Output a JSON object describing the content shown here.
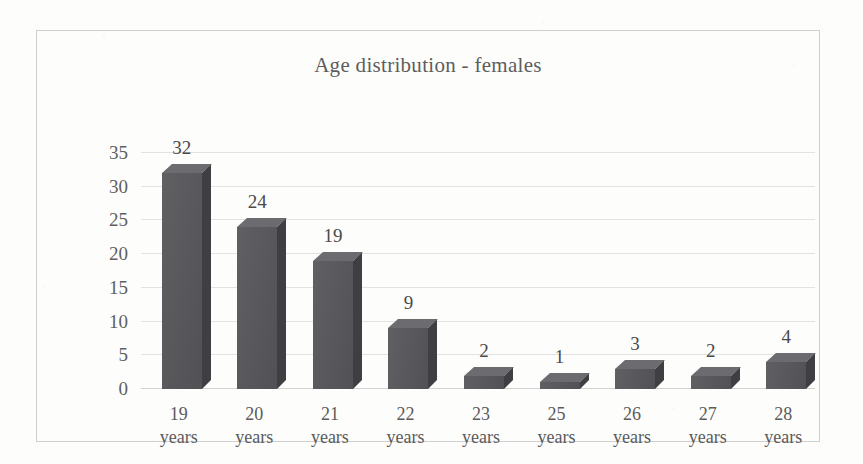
{
  "chart_data": {
    "type": "bar",
    "title": "Age distribution - females",
    "xlabel": "",
    "ylabel": "",
    "categories": [
      "19 years",
      "20 years",
      "21 years",
      "22 years",
      "23 years",
      "25 years",
      "26 years",
      "27 years",
      "28 years"
    ],
    "category_numbers": [
      "19",
      "20",
      "21",
      "22",
      "23",
      "25",
      "26",
      "27",
      "28"
    ],
    "category_unit": "years",
    "values": [
      32,
      24,
      19,
      9,
      2,
      1,
      3,
      2,
      4
    ],
    "data_labels": [
      "32",
      "24",
      "19",
      "9",
      "2",
      "1",
      "3",
      "2",
      "4"
    ],
    "ylim": [
      0,
      35
    ],
    "yticks": [
      0,
      5,
      10,
      15,
      20,
      25,
      30,
      35
    ],
    "ytick_labels": [
      "0",
      "5",
      "10",
      "15",
      "20",
      "25",
      "30",
      "35"
    ],
    "grid": true,
    "legend": false,
    "style": "3d-column",
    "colors": {
      "bar_front": "#56565a",
      "bar_top": "#6c6c70",
      "bar_side": "#3f3f43",
      "gridline": "#e2e2e2",
      "frame_border": "#cfcfcf",
      "text": "#5b5b5b",
      "background": "#fdfdfb"
    }
  }
}
